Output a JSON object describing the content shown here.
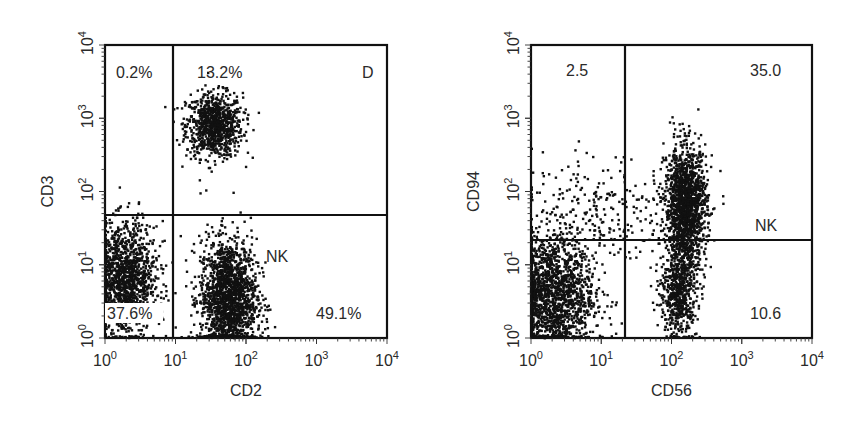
{
  "figure": {
    "panels": [
      {
        "id": "left",
        "x_label": "CD2",
        "y_label": "CD3",
        "frame": {
          "x0": 105,
          "y0": 45,
          "x1": 387,
          "y1": 338
        },
        "gate": {
          "x": 173,
          "y_left": 215,
          "y_right": 215
        },
        "x_ticks": [
          "10^0",
          "10^1",
          "10^2",
          "10^3",
          "10^4"
        ],
        "y_ticks": [
          "10^0",
          "10^1",
          "10^2",
          "10^3",
          "10^4"
        ],
        "quadrant_labels": [
          {
            "text": "0.2%",
            "x": 116,
            "y": 78
          },
          {
            "text": "13.2%",
            "x": 197,
            "y": 78
          },
          {
            "text": "D",
            "x": 362,
            "y": 78
          },
          {
            "text": "NK",
            "x": 266,
            "y": 262
          },
          {
            "text": "37.6%",
            "x": 107,
            "y": 319
          },
          {
            "text": "49.1%",
            "x": 316,
            "y": 319
          }
        ]
      },
      {
        "id": "right",
        "x_label": "CD56",
        "y_label": "CD94",
        "frame": {
          "x0": 531,
          "y0": 45,
          "x1": 812,
          "y1": 338
        },
        "gate": {
          "x": 625,
          "y_left": 240,
          "y_right": 240
        },
        "x_ticks": [
          "10^0",
          "10^1",
          "10^2",
          "10^3",
          "10^4"
        ],
        "y_ticks": [
          "10^0",
          "10^1",
          "10^2",
          "10^3",
          "10^4"
        ],
        "quadrant_labels": [
          {
            "text": "2.5",
            "x": 566,
            "y": 76
          },
          {
            "text": "35.0",
            "x": 750,
            "y": 76
          },
          {
            "text": "NK",
            "x": 755,
            "y": 231
          },
          {
            "text": "10.6",
            "x": 750,
            "y": 319
          }
        ]
      }
    ]
  },
  "chart_data": [
    {
      "type": "scatter",
      "title": "",
      "xlabel": "CD2",
      "ylabel": "CD3",
      "xscale": "log",
      "yscale": "log",
      "xlim": [
        1,
        10000
      ],
      "ylim": [
        1,
        10000
      ],
      "grid": false,
      "gates": {
        "x": 9,
        "y": 50
      },
      "quadrants": [
        {
          "position": "upper-left",
          "label": "0.2%"
        },
        {
          "position": "upper-right",
          "label": "13.2%"
        },
        {
          "position": "lower-left",
          "label": "37.6%"
        },
        {
          "position": "lower-right",
          "label": "49.1%"
        }
      ],
      "annotations": [
        "D",
        "NK"
      ],
      "clusters": [
        {
          "name": "CD3+ T cells",
          "cx_log": 1.55,
          "cy_log": 2.9,
          "sx": 0.2,
          "sy": 0.22,
          "n": 900
        },
        {
          "name": "CD2+ NK cells",
          "cx_log": 1.75,
          "cy_log": 0.55,
          "sx": 0.2,
          "sy": 0.4,
          "n": 1700
        },
        {
          "name": "CD2- CD3- cells",
          "cx_log": 0.3,
          "cy_log": 0.8,
          "sx": 0.22,
          "sy": 0.38,
          "n": 1300
        }
      ]
    },
    {
      "type": "scatter",
      "title": "",
      "xlabel": "CD56",
      "ylabel": "CD94",
      "xscale": "log",
      "yscale": "log",
      "xlim": [
        1,
        10000
      ],
      "ylim": [
        1,
        10000
      ],
      "grid": false,
      "gates": {
        "x": 22,
        "y": 22
      },
      "quadrants": [
        {
          "position": "upper-left",
          "label": "2.5"
        },
        {
          "position": "upper-right",
          "label": "35.0"
        },
        {
          "position": "lower-right",
          "label": "10.6"
        }
      ],
      "annotations": [
        "NK"
      ],
      "clusters": [
        {
          "name": "CD56+ CD94+ NK",
          "cx_log": 2.2,
          "cy_log": 1.8,
          "sx": 0.15,
          "sy": 0.4,
          "n": 1600
        },
        {
          "name": "CD56+ CD94- NK",
          "cx_log": 2.1,
          "cy_log": 0.6,
          "sx": 0.13,
          "sy": 0.3,
          "n": 600
        },
        {
          "name": "CD56- cells",
          "cx_log": 0.3,
          "cy_log": 0.6,
          "sx": 0.3,
          "sy": 0.4,
          "n": 1600
        },
        {
          "name": "scattered",
          "cx_log": 0.9,
          "cy_log": 1.7,
          "sx": 0.5,
          "sy": 0.4,
          "n": 260
        }
      ]
    }
  ]
}
